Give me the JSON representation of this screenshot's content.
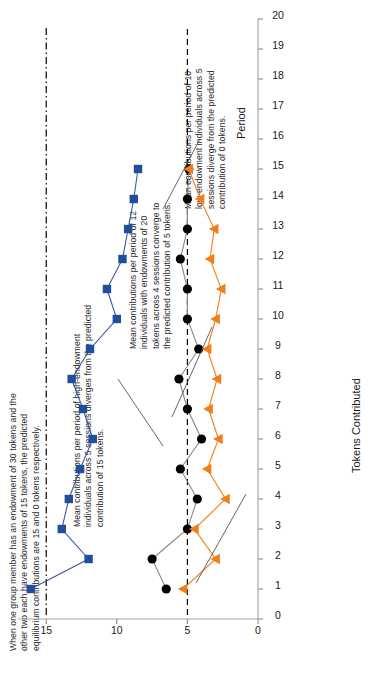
{
  "figure": {
    "annotations": [
      {
        "id": "setup-note",
        "text": "When one group member has an endowment of 30 tokens and the other two each have endowments of 15 tokens, the predicted equilibrium contributions are 15 and 0 tokens respectively."
      },
      {
        "id": "high-endowment-note",
        "text": "Mean contributions per period of high-endowment individuals across 5 sessions diverges from the predicted contribution of 15 tokens."
      },
      {
        "id": "homogeneous-note",
        "text": "Mean contributions per period of 12 individuals with endowments of 20 tokens across 4 sessions converge to the predicted contribution of 5 tokens."
      },
      {
        "id": "low-endowment-note",
        "text": "Mean contributions per period of 10 low-endowment individuals across 5 sessions diverge from the predicted contribution of 0 tokens."
      }
    ]
  },
  "chart_data": {
    "type": "line",
    "title": "",
    "xlabel": "Period",
    "ylabel": "Tokens Contributed",
    "xlim": [
      0,
      20
    ],
    "ylim": [
      0,
      17
    ],
    "xticks": [
      0,
      1,
      2,
      3,
      4,
      5,
      6,
      7,
      8,
      9,
      10,
      11,
      12,
      13,
      14,
      15,
      16,
      17,
      18,
      19,
      20
    ],
    "yticks": [
      0,
      5,
      10,
      15
    ],
    "grid": false,
    "legend_position": "none",
    "x": [
      1,
      2,
      3,
      4,
      5,
      6,
      7,
      8,
      9,
      10,
      11,
      12,
      13,
      14,
      15
    ],
    "reference_lines": [
      {
        "name": "predicted-15",
        "value": 15,
        "style": "dash-dot",
        "color": "#000000"
      },
      {
        "name": "predicted-5",
        "value": 5,
        "style": "dashed",
        "color": "#000000"
      }
    ],
    "series": [
      {
        "name": "High-endowment individuals (endowment 30)",
        "marker": "square",
        "color": "#1f4e9c",
        "line_color": "#3a5a9b",
        "values": [
          16.1,
          12.0,
          13.9,
          13.4,
          12.6,
          11.7,
          12.4,
          13.2,
          11.9,
          10.0,
          10.7,
          9.6,
          9.2,
          8.8,
          8.5
        ]
      },
      {
        "name": "Homogeneous individuals (endowment 20)",
        "marker": "circle",
        "color": "#000000",
        "line_color": "#888888",
        "values": [
          6.5,
          7.5,
          5.0,
          4.3,
          5.5,
          4.0,
          5.0,
          5.6,
          4.2,
          5.0,
          5.0,
          5.5,
          5.0,
          5.0,
          4.9
        ]
      },
      {
        "name": "Low-endowment individuals (endowment 15)",
        "marker": "triangle",
        "color": "#f07f1a",
        "line_color": "#f07f1a",
        "values": [
          5.3,
          3.0,
          4.5,
          2.3,
          3.6,
          2.8,
          3.5,
          2.9,
          3.6,
          3.0,
          2.6,
          3.4,
          3.1,
          4.1,
          4.9
        ]
      }
    ]
  }
}
